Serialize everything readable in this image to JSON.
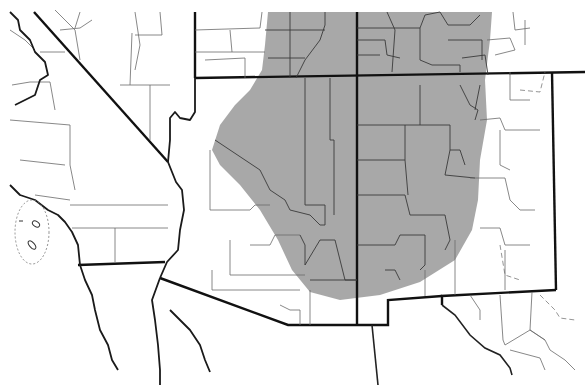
{
  "map": {
    "region": "Southwestern United States (Four Corners)",
    "style": "black-and-white county outline map",
    "states_visible": [
      "California",
      "Nevada",
      "Utah",
      "Colorado",
      "Arizona",
      "New Mexico",
      "Texas"
    ],
    "colors": {
      "background": "#ffffff",
      "range_fill": "#a3a3a3",
      "state_border": "#111111",
      "county_border": "#3a3a3a"
    },
    "shaded_area": {
      "meaning": "distribution range",
      "covers": [
        "northeastern Arizona",
        "southeastern Utah",
        "southwestern Colorado",
        "northwestern New Mexico"
      ]
    },
    "insets": [
      {
        "name": "channel-islands-outline",
        "style": "dotted ellipse"
      }
    ]
  }
}
